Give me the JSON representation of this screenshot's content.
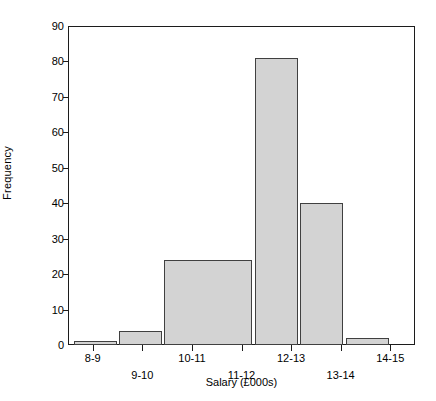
{
  "chart_data": {
    "type": "bar",
    "title": "",
    "subtitle": "",
    "xlabel": "Salary (£000s)",
    "ylabel": "Frequency",
    "categories": [
      "8-9",
      "9-10",
      "10-11",
      "11-12",
      "12-13",
      "13-14",
      "14-15"
    ],
    "values": [
      1,
      4,
      24,
      24,
      81,
      40,
      2
    ],
    "series": [
      {
        "name": "Frequency",
        "values": [
          1,
          4,
          24,
          24,
          81,
          40,
          2
        ]
      }
    ],
    "ylim": [
      0,
      90
    ],
    "ytick_values": [
      0,
      10,
      20,
      30,
      40,
      50,
      60,
      70,
      80,
      90
    ],
    "ytick_labels": [
      "0",
      "10",
      "20",
      "30",
      "40",
      "50",
      "60",
      "70",
      "80",
      "90"
    ],
    "xtick_labels": [
      "8-9",
      "9-10",
      "10-11",
      "11-12",
      "12-13",
      "13-14",
      "14-15"
    ],
    "grid": false,
    "legend": false,
    "legend_position": "none",
    "bars": [
      {
        "label": "8-9",
        "value": 1,
        "left_pct": 1.7,
        "width_pct": 12.4,
        "row": "a"
      },
      {
        "label": "9-10",
        "value": 4,
        "left_pct": 14.7,
        "width_pct": 12.4,
        "row": "b"
      },
      {
        "label": "10-11",
        "value": 24,
        "left_pct": 27.7,
        "width_pct": 25.4,
        "row": "a"
      },
      {
        "label": "11-12",
        "value": 24,
        "left_pct": 53.4,
        "width_pct": 0.0,
        "row": "b"
      },
      {
        "label": "12-13",
        "value": 81,
        "left_pct": 53.9,
        "width_pct": 12.4,
        "row": "a"
      },
      {
        "label": "13-14",
        "value": 40,
        "left_pct": 66.9,
        "width_pct": 12.4,
        "row": "b"
      },
      {
        "label": "14-15",
        "value": 2,
        "left_pct": 80.1,
        "width_pct": 12.4,
        "row": "a"
      }
    ]
  },
  "style": {
    "bar_fill": "#d3d3d3",
    "bar_stroke": "#404040",
    "axis_color": "#1c1c1c",
    "background": "#ffffff",
    "text_color": "#000000"
  }
}
